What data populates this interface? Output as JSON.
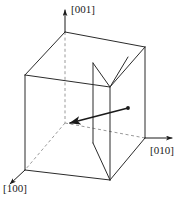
{
  "figure": {
    "background_color": "#ffffff",
    "line_color": "#2b2b2b",
    "dashed_color": "#9a9a9a",
    "vector_color": "#1a1a1a"
  },
  "axes": [
    {
      "id": "axis-001",
      "label": "[001]",
      "direction": "up",
      "label_x": 74,
      "label_y": 9,
      "arrow_from_x": 65,
      "arrow_from_y": 32,
      "arrow_to_x": 65,
      "arrow_to_y": 8,
      "style": "solid"
    },
    {
      "id": "axis-010",
      "label": "[010]",
      "direction": "right",
      "label_x": 151,
      "label_y": 150,
      "arrow_from_x": 145,
      "arrow_from_y": 138,
      "arrow_to_x": 174,
      "arrow_to_y": 138,
      "style": "solid"
    },
    {
      "id": "axis-100",
      "label": "[100]",
      "direction": "down-left",
      "label_x": 4,
      "label_y": 188,
      "arrow_from_x": 25,
      "arrow_from_y": 170,
      "arrow_to_x": 8,
      "arrow_to_y": 186,
      "style": "solid"
    }
  ],
  "cell": {
    "shape": "rectangular-prism",
    "vertices": {
      "back_top_left": [
        25,
        75
      ],
      "back_top_origin": [
        65,
        32
      ],
      "back_top_right": [
        145,
        47
      ],
      "front_top_mid": [
        110,
        87
      ],
      "back_bottom_origin": [
        65,
        123
      ],
      "back_bottom_left": [
        25,
        170
      ],
      "back_bottom_right": [
        145,
        138
      ],
      "front_bottom_mid": [
        110,
        180
      ]
    },
    "hidden_edges_style": "dashed"
  },
  "internal_plane": {
    "name": "intersecting-lattice-plane",
    "visible_outline": [
      [
        110,
        87
      ],
      [
        93,
        63
      ],
      [
        93,
        143
      ],
      [
        110,
        180
      ]
    ],
    "notch_apex": [
      128,
      57
    ]
  },
  "direction_vector": {
    "name": "direction-vector",
    "tail_x": 128,
    "tail_y": 108,
    "head_x": 67,
    "head_y": 124,
    "has_arrowhead_at_head": true,
    "has_dot_at_tail": true,
    "line_width": 1.6
  }
}
